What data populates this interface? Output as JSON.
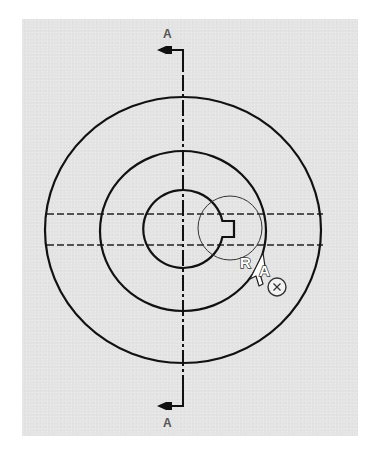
{
  "view": {
    "title": "Section view definition A-A",
    "background": "#e4e4e4",
    "line_color": "#111111"
  },
  "section_markers": {
    "top_label": "A",
    "bottom_label": "A"
  },
  "geometry": {
    "center": [
      183,
      230
    ],
    "outer_circle": {
      "rx": 138,
      "ry": 133
    },
    "middle_circle": {
      "rx": 83,
      "ry": 80
    },
    "inner_bore": {
      "rx": 40,
      "ry": 39
    },
    "keyway": {
      "x1": 223,
      "x2": 234,
      "y1": 221,
      "y2": 237
    },
    "selection_circle": {
      "cx": 230,
      "cy": 228,
      "r": 32
    },
    "hidden_lines_y": [
      214,
      245
    ]
  },
  "cursor": {
    "icon": "arrow-pointer-icon",
    "glyph_left": "R",
    "glyph_right": "A",
    "badge_icon": "circle-x-icon",
    "tip": [
      262,
      255
    ]
  }
}
